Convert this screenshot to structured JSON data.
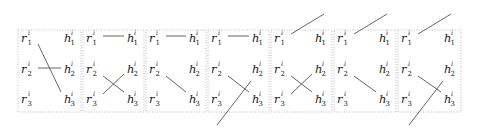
{
  "diagram": {
    "superscript": "i",
    "left_nodes": [
      {
        "base": "r",
        "sub": "1"
      },
      {
        "base": "r",
        "sub": "2"
      },
      {
        "base": "r",
        "sub": "3"
      }
    ],
    "right_nodes": [
      {
        "base": "h",
        "sub": "1"
      },
      {
        "base": "h",
        "sub": "2"
      },
      {
        "base": "h",
        "sub": "3"
      }
    ],
    "panels": [
      {
        "index": 1,
        "edges": [
          [
            "r1",
            "h3"
          ],
          [
            "r2",
            "h2"
          ]
        ],
        "outside_lines": []
      },
      {
        "index": 2,
        "edges": [
          [
            "r1",
            "h1"
          ],
          [
            "r2",
            "h3"
          ],
          [
            "r3",
            "h2"
          ]
        ],
        "outside_lines": []
      },
      {
        "index": 3,
        "edges": [
          [
            "r1",
            "h1"
          ],
          [
            "r2",
            "h3"
          ]
        ],
        "outside_lines": []
      },
      {
        "index": 4,
        "edges": [
          [
            "r1",
            "h1"
          ],
          [
            "r2",
            "h3"
          ]
        ],
        "outside_lines": [
          "h2-to-below"
        ]
      },
      {
        "index": 5,
        "edges": [
          [
            "r2",
            "h3"
          ],
          [
            "r3",
            "h2"
          ]
        ],
        "outside_lines": [
          "r1-to-above"
        ]
      },
      {
        "index": 6,
        "edges": [
          [
            "r2",
            "h3"
          ]
        ],
        "outside_lines": [
          "r1-to-above"
        ]
      },
      {
        "index": 7,
        "edges": [
          [
            "r2",
            "h3"
          ]
        ],
        "outside_lines": [
          "r1-to-above",
          "h2-to-below"
        ]
      }
    ]
  }
}
